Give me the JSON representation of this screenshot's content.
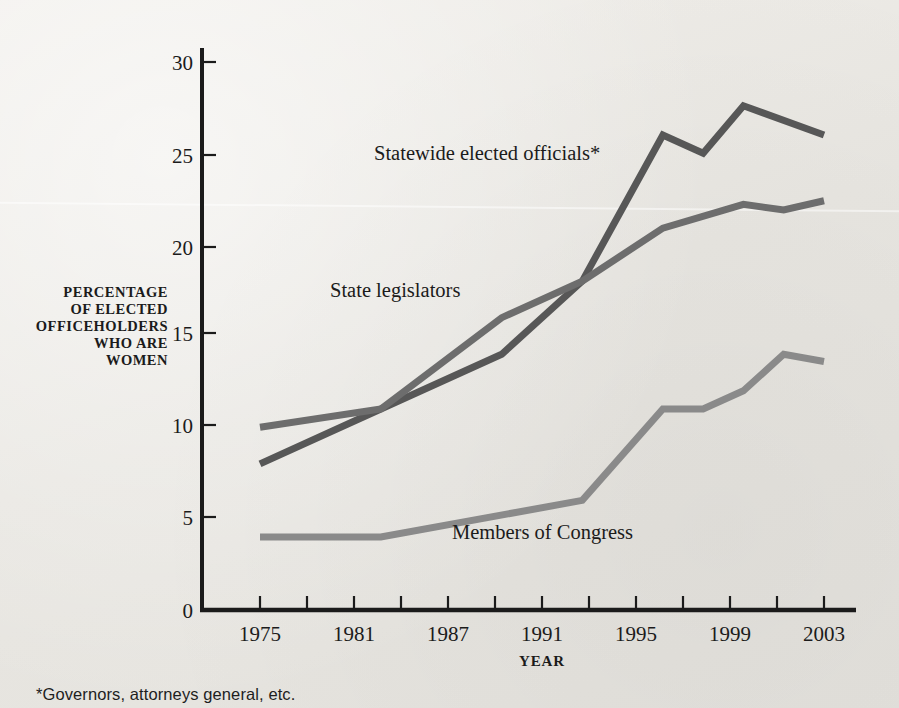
{
  "chart_data": {
    "type": "line",
    "title": "",
    "xlabel": "YEAR",
    "ylabel": "PERCENTAGE OF ELECTED OFFICEHOLDERS WHO ARE WOMEN",
    "ylabel_lines": [
      "PERCENTAGE",
      "OF ELECTED",
      "OFFICEHOLDERS",
      "WHO ARE",
      "WOMEN"
    ],
    "ylim": [
      0,
      30
    ],
    "yticks": [
      0,
      5,
      10,
      15,
      20,
      25,
      30
    ],
    "ytick_labels": [
      "0",
      "5",
      "10",
      "15",
      "20",
      "25",
      "30"
    ],
    "xlim": [
      1975,
      2003
    ],
    "xticks": [
      1975,
      1977,
      1979,
      1981,
      1983,
      1985,
      1987,
      1989,
      1991,
      1993,
      1995,
      1997,
      1999,
      2001,
      2003
    ],
    "xtick_labels": [
      "1975",
      "",
      "",
      "1981",
      "",
      "",
      "1987",
      "",
      "1991",
      "",
      "1995",
      "",
      "1999",
      "",
      "2003"
    ],
    "x_labeled": [
      "1975",
      "1981",
      "1987",
      "1991",
      "1995",
      "1999",
      "2003"
    ],
    "grid": false,
    "legend": "inline-labels",
    "series": [
      {
        "name": "Statewide elected officials*",
        "label": "Statewide elected officials*",
        "color": "#575757",
        "x": [
          1975,
          1981,
          1987,
          1991,
          1995,
          1997,
          1999,
          2003
        ],
        "values": [
          8.0,
          11.0,
          14.0,
          18.0,
          26.0,
          25.0,
          27.6,
          26.0
        ]
      },
      {
        "name": "State legislators",
        "label": "State legislators",
        "color": "#6d6d6d",
        "x": [
          1975,
          1981,
          1987,
          1991,
          1995,
          1999,
          2001,
          2003
        ],
        "values": [
          10.0,
          11.0,
          16.0,
          18.0,
          20.9,
          22.2,
          21.9,
          22.4
        ]
      },
      {
        "name": "Members of Congress",
        "label": "Members of Congress",
        "color": "#8a8a8a",
        "x": [
          1975,
          1981,
          1991,
          1995,
          1997,
          1999,
          2001,
          2003
        ],
        "values": [
          4.0,
          4.0,
          6.0,
          11.0,
          11.0,
          12.0,
          14.0,
          13.6
        ]
      }
    ],
    "annotations": [
      {
        "name": "statewide-label",
        "text": "Statewide elected officials*",
        "x": 374,
        "y": 160
      },
      {
        "name": "legislators-label",
        "text": "State legislators",
        "x": 330,
        "y": 297
      },
      {
        "name": "congress-label",
        "text": "Members of Congress",
        "x": 452,
        "y": 539
      }
    ]
  },
  "footnote": "*Governors, attorneys general, etc.",
  "colors": {
    "background": "#eceae6",
    "axis": "#1b1b1b",
    "statewide": "#575757",
    "legislators": "#6d6d6d",
    "congress": "#8a8a8a"
  }
}
